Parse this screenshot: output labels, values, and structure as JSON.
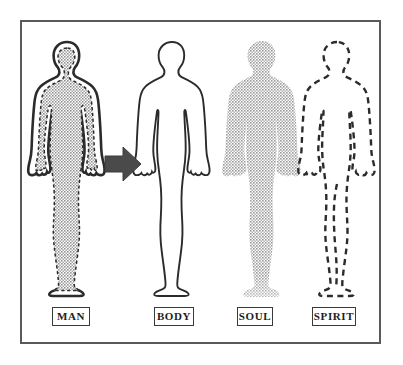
{
  "diagram": {
    "frame_border_color": "#5a5a5a",
    "background_color": "#ffffff",
    "figures": [
      {
        "id": "man",
        "label": "MAN",
        "icon_name": "human-figure-shaded",
        "style": "solid outline with white band, dashed inner contour and gray stippled fill",
        "outline_color": "#2b2b2b",
        "fill_color": "#9a9a9a",
        "inner_dash_color": "#2b2b2b"
      },
      {
        "id": "body",
        "label": "BODY",
        "icon_name": "human-figure-outline",
        "style": "thin solid outline, white fill",
        "outline_color": "#2b2b2b",
        "fill_color": "#ffffff",
        "inner_dash_color": ""
      },
      {
        "id": "soul",
        "label": "SOUL",
        "icon_name": "human-figure-stippled",
        "style": "gray stippled silhouette, no outline, feet fading",
        "outline_color": "",
        "fill_color": "#9e9e9e",
        "inner_dash_color": ""
      },
      {
        "id": "spirit",
        "label": "SPIRIT",
        "icon_name": "human-figure-dashed",
        "style": "dashed outline only, no fill, dashed inner leg lines",
        "outline_color": "#2b2b2b",
        "fill_color": "none",
        "inner_dash_color": "#2b2b2b"
      }
    ],
    "arrow": {
      "icon_name": "arrow-right-icon",
      "direction": "right",
      "color": "#4a4a4a",
      "meaning": "equals / consists of"
    }
  }
}
